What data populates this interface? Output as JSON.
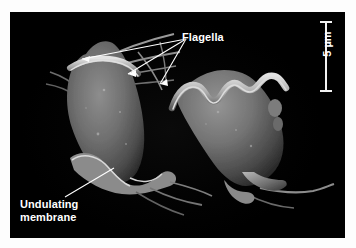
{
  "figure": {
    "type": "scanning-electron-micrograph",
    "background_color": "#000000",
    "border_color": "#ffffff",
    "annotation_color": "#ffffff"
  },
  "labels": {
    "flagella": "Flagella",
    "undulating_membrane": "Undulating\nmembrane"
  },
  "scale_bar": {
    "value": "5",
    "unit": "µm",
    "text": "5 µm",
    "orientation": "vertical",
    "color": "#f2f2f2"
  },
  "leader_lines": {
    "flagella": {
      "origin_x": 176,
      "origin_y": 27,
      "targets": [
        {
          "x": 72,
          "y": 47
        },
        {
          "x": 118,
          "y": 62
        },
        {
          "x": 150,
          "y": 72
        }
      ]
    },
    "undulating_membrane": {
      "origin_x": 55,
      "origin_y": 185,
      "target_x": 104,
      "target_y": 156
    }
  },
  "cells": [
    {
      "name": "left-cell",
      "shape": "pear",
      "body_color": "#6e6e6e",
      "edge_color": "#c8c8c8",
      "has_undulating_membrane": true,
      "has_flagella": true
    },
    {
      "name": "right-cell",
      "shape": "elongate-teardrop",
      "body_color": "#6a6a6a",
      "edge_color": "#d0d0d0",
      "has_undulating_membrane": true,
      "has_flagella": true
    }
  ]
}
